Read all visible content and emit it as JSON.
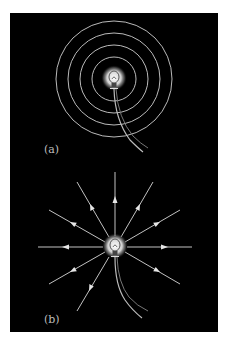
{
  "figure": {
    "background": "#000000",
    "line_color": "#d8d8d8",
    "panel_a": {
      "label": "(a)",
      "description": "Light bulb emitting concentric circular wavefronts",
      "ring_count": 4
    },
    "panel_b": {
      "label": "(b)",
      "description": "Light bulb emitting radial rays with outward arrows",
      "ray_count": 12
    }
  }
}
